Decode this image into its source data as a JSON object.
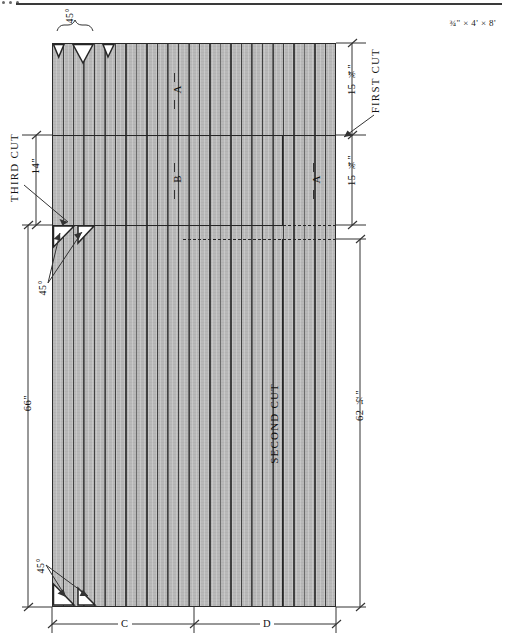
{
  "drawing": {
    "title": "Plywood cutting diagram",
    "stock_spec": {
      "thickness": "3/4\"",
      "width": "4'",
      "length": "8'",
      "text": "¾\" × 4' × 8'"
    },
    "parts": [
      {
        "id": "part-a-top",
        "label": "A"
      },
      {
        "id": "part-b",
        "label": "B"
      },
      {
        "id": "part-a-right",
        "label": "A"
      }
    ],
    "cuts": [
      {
        "id": "first-cut",
        "label": "FIRST CUT"
      },
      {
        "id": "second-cut",
        "label": "SECOND CUT"
      },
      {
        "id": "third-cut",
        "label": "THIRD CUT"
      }
    ],
    "dimensions": {
      "right": [
        {
          "id": "dim-15-3-4-upper",
          "value": "15 ¾\""
        },
        {
          "id": "dim-15-3-4-lower",
          "value": "15 ¾\""
        },
        {
          "id": "dim-62-1-2",
          "value": "62 ½\""
        }
      ],
      "left": [
        {
          "id": "dim-14",
          "value": "14\""
        },
        {
          "id": "dim-66",
          "value": "66\""
        }
      ],
      "bottom": [
        {
          "id": "dim-c",
          "value": "C"
        },
        {
          "id": "dim-d",
          "value": "D"
        }
      ]
    },
    "angles": [
      {
        "id": "angle-top",
        "value": "45°"
      },
      {
        "id": "angle-middle",
        "value": "45°"
      },
      {
        "id": "angle-bottom",
        "value": "45°"
      }
    ],
    "colors": {
      "panel_fill": "#b9b9b9",
      "line": "#262626",
      "paper": "#ffffff"
    }
  }
}
